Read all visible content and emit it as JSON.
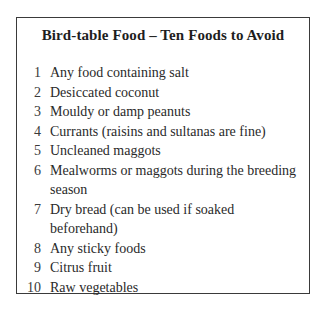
{
  "panel": {
    "title": "Bird-table Food – Ten Foods to Avoid",
    "items": [
      {
        "number": "1",
        "text": "Any food containing salt"
      },
      {
        "number": "2",
        "text": "Desiccated coconut"
      },
      {
        "number": "3",
        "text": "Mouldy or damp peanuts"
      },
      {
        "number": "4",
        "text": "Currants (raisins and sultanas are fine)"
      },
      {
        "number": "5",
        "text": "Uncleaned maggots"
      },
      {
        "number": "6",
        "text": "Mealworms or maggots during the breeding season"
      },
      {
        "number": "7",
        "text": "Dry bread (can be used if soaked beforehand)"
      },
      {
        "number": "8",
        "text": "Any sticky foods"
      },
      {
        "number": "9",
        "text": "Citrus fruit"
      },
      {
        "number": "10",
        "text": "Raw vegetables"
      }
    ]
  }
}
